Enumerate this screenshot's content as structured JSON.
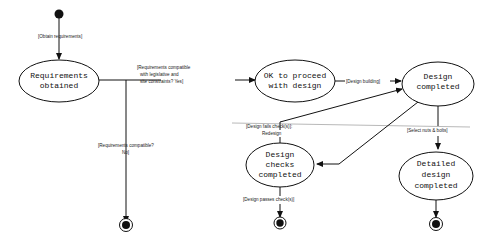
{
  "diagram": {
    "type": "UML state diagram",
    "states": [
      {
        "id": "req_obtained",
        "lines": [
          "Requirements",
          "obtained"
        ]
      },
      {
        "id": "ok_proceed",
        "lines": [
          "OK to proceed",
          "with design"
        ]
      },
      {
        "id": "design_completed",
        "lines": [
          "Design",
          "completed"
        ]
      },
      {
        "id": "design_checks",
        "lines": [
          "Design",
          "checks",
          "completed"
        ]
      },
      {
        "id": "detailed_design",
        "lines": [
          "Detailed",
          "design",
          "completed"
        ]
      }
    ],
    "transitions": [
      {
        "from": "initial",
        "to": "req_obtained",
        "label": "[Obtain requirements]"
      },
      {
        "from": "req_obtained",
        "to": "ok_proceed",
        "label_lines": [
          "[Requirements compatible",
          "with legislative and",
          "site constraints? Yes]"
        ]
      },
      {
        "from": "req_obtained",
        "to": "final_1",
        "label_lines": [
          "[Requirements compatible?",
          "No]"
        ]
      },
      {
        "from": "ok_proceed",
        "to": "design_completed",
        "label": "[Design building]"
      },
      {
        "from": "design_checks",
        "to": "design_completed",
        "label_lines": [
          "[Design fails check(s)]:",
          "Redesign"
        ]
      },
      {
        "from": "design_completed",
        "to": "design_checks",
        "label": ""
      },
      {
        "from": "design_completed",
        "to": "detailed_design",
        "label": "[Select nuts & bolts]"
      },
      {
        "from": "design_checks",
        "to": "final_2",
        "label": "[Design passes check(s)]"
      },
      {
        "from": "detailed_design",
        "to": "final_3",
        "label": ""
      }
    ]
  }
}
